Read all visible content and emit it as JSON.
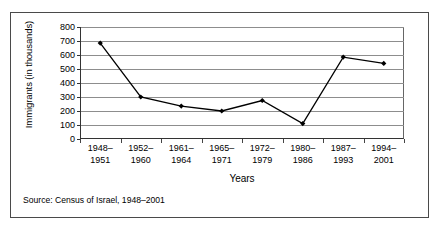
{
  "chart_data": {
    "type": "line",
    "title": "",
    "xlabel": "Years",
    "ylabel": "Immigrants (in thousands)",
    "categories": [
      "1948–\n1951",
      "1952–\n1960",
      "1961–\n1964",
      "1965–\n1971",
      "1972–\n1979",
      "1980–\n1986",
      "1987–\n1993",
      "1994–\n2001"
    ],
    "categories_line1": [
      "1948–",
      "1952–",
      "1961–",
      "1965–",
      "1972–",
      "1980–",
      "1987–",
      "1994–"
    ],
    "categories_line2": [
      "1951",
      "1960",
      "1964",
      "1971",
      "1979",
      "1986",
      "1993",
      "2001"
    ],
    "values": [
      685,
      300,
      235,
      200,
      275,
      110,
      585,
      540
    ],
    "ylim": [
      0,
      800
    ],
    "ytick_values": [
      0,
      100,
      200,
      300,
      400,
      500,
      600,
      700,
      800
    ],
    "ytick_labels": [
      "0",
      "100",
      "200",
      "300",
      "400",
      "500",
      "600",
      "700",
      "800"
    ],
    "grid": true,
    "legend": "none",
    "series_color": "#000000",
    "grid_color": "#8d8d8d",
    "marker": "diamond"
  },
  "source": {
    "text": "Source: Census of Israel, 1948–2001"
  }
}
